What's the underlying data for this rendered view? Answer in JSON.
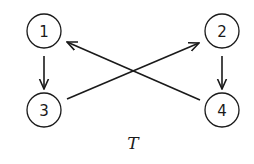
{
  "diagram": {
    "caption": "T",
    "nodes": [
      {
        "id": "1",
        "label": "1"
      },
      {
        "id": "2",
        "label": "2"
      },
      {
        "id": "3",
        "label": "3"
      },
      {
        "id": "4",
        "label": "4"
      }
    ],
    "edges": [
      {
        "from": "1",
        "to": "3"
      },
      {
        "from": "2",
        "to": "4"
      },
      {
        "from": "4",
        "to": "1"
      },
      {
        "from": "3",
        "to": "2"
      }
    ]
  }
}
